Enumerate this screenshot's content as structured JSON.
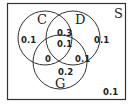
{
  "diagram": {
    "type": "venn",
    "universe_label": "S",
    "sets": [
      {
        "name": "C",
        "label": "C"
      },
      {
        "name": "D",
        "label": "D"
      },
      {
        "name": "G",
        "label": "G"
      }
    ],
    "regions": {
      "C_only": "0.1",
      "D_only": "0.1",
      "G_only": "0.2",
      "C_and_D_only": "0.3",
      "C_and_D_and_G": "0.1",
      "C_and_G_only": "0",
      "D_and_G_only": "0.1",
      "outside": "0.1"
    },
    "colors": {
      "stroke": "#333333",
      "text": "#222222",
      "background": "#ffffff"
    }
  }
}
